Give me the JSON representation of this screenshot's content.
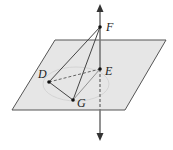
{
  "diagram": {
    "type": "geometry-3d",
    "colors": {
      "plane_fill": "#e6e6e6",
      "plane_stroke": "#555555",
      "line_stroke": "#444444",
      "axis_stroke": "#777777",
      "ellipse_stroke": "#cfcfcf"
    },
    "points": [
      {
        "id": "F",
        "label": "F",
        "x": 100,
        "y": 27
      },
      {
        "id": "E",
        "label": "E",
        "x": 100,
        "y": 69
      },
      {
        "id": "D",
        "label": "D",
        "x": 49,
        "y": 82
      },
      {
        "id": "G",
        "label": "G",
        "x": 73,
        "y": 100
      }
    ],
    "segments": [
      {
        "from": "F",
        "to": "D",
        "style": "solid"
      },
      {
        "from": "F",
        "to": "G",
        "style": "solid"
      },
      {
        "from": "D",
        "to": "G",
        "style": "solid"
      },
      {
        "from": "G",
        "to": "E",
        "style": "solid"
      },
      {
        "from": "D",
        "to": "E",
        "style": "dashed"
      }
    ],
    "plane": {
      "corners": [
        [
          55,
          40
        ],
        [
          166,
          40
        ],
        [
          125,
          110
        ],
        [
          12,
          110
        ]
      ]
    },
    "axis": {
      "x": 100,
      "top": 5,
      "bottom": 140,
      "arrows": "both"
    }
  }
}
